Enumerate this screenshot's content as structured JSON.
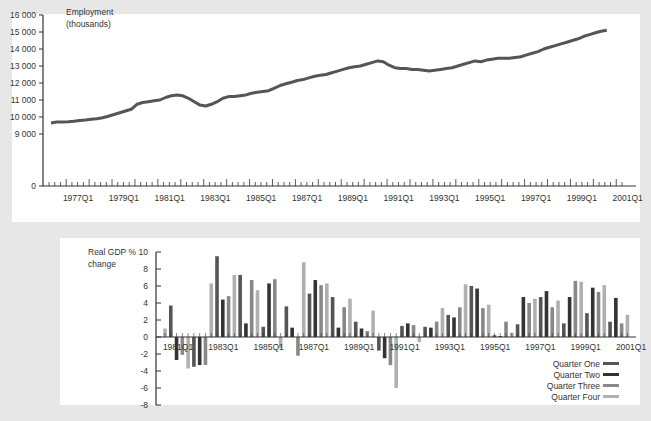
{
  "chart_data": [
    {
      "type": "line",
      "title": "Employment (thousands)",
      "ylabel_line1": "Employment",
      "ylabel_line2": "(thousands)",
      "xlabel": "",
      "yticks": [
        0,
        9000,
        10000,
        11000,
        12000,
        13000,
        14000,
        15000,
        16000
      ],
      "ytick_labels": [
        "0",
        "9 000",
        "10 000",
        "11 000",
        "12 000",
        "13 000",
        "14 000",
        "15 000",
        "16 000"
      ],
      "ylim": [
        0,
        16000
      ],
      "axis_break": "between 0 and 9000",
      "xtick_labels": [
        "1977Q1",
        "1979Q1",
        "1981Q1",
        "1983Q1",
        "1985Q1",
        "1987Q1",
        "1989Q1",
        "1991Q1",
        "1993Q1",
        "1995Q1",
        "1997Q1",
        "1999Q1",
        "2001Q1"
      ],
      "x_start": "1976Q2",
      "x_end": "2001Q2",
      "series": [
        {
          "name": "Employment",
          "color": "#555555",
          "annual_q1_values": {
            "1976": 9650,
            "1977": 9750,
            "1978": 9900,
            "1979": 10250,
            "1980": 10850,
            "1981": 11150,
            "1982": 11100,
            "1983": 10750,
            "1984": 11200,
            "1985": 11450,
            "1986": 11850,
            "1987": 12200,
            "1988": 12500,
            "1989": 12900,
            "1990": 13200,
            "1991": 12900,
            "1992": 12800,
            "1993": 12700,
            "1994": 12900,
            "1995": 13300,
            "1996": 13450,
            "1997": 13650,
            "1998": 14000,
            "1999": 14400,
            "2000": 14800,
            "2001": 15050
          },
          "values": [
            9650,
            9700,
            9700,
            9720,
            9750,
            9800,
            9830,
            9870,
            9900,
            9950,
            10050,
            10150,
            10250,
            10350,
            10450,
            10750,
            10850,
            10900,
            10950,
            11000,
            11150,
            11250,
            11300,
            11250,
            11100,
            10900,
            10700,
            10650,
            10750,
            10900,
            11100,
            11200,
            11200,
            11250,
            11300,
            11400,
            11450,
            11500,
            11550,
            11700,
            11850,
            11950,
            12050,
            12150,
            12200,
            12300,
            12400,
            12450,
            12500,
            12600,
            12700,
            12800,
            12900,
            12950,
            13000,
            13100,
            13200,
            13300,
            13250,
            13050,
            12900,
            12850,
            12850,
            12800,
            12800,
            12750,
            12700,
            12750,
            12800,
            12850,
            12900,
            13000,
            13100,
            13200,
            13300,
            13250,
            13350,
            13400,
            13450,
            13450,
            13450,
            13500,
            13550,
            13650,
            13750,
            13850,
            14000,
            14100,
            14200,
            14300,
            14400,
            14500,
            14600,
            14750,
            14850,
            14950,
            15050,
            15100
          ]
        }
      ]
    },
    {
      "type": "bar",
      "title": "Real GDP % change",
      "ylabel_line1": "Real GDP %",
      "ylabel_line2": "change",
      "yticks": [
        -8,
        -6,
        -4,
        -2,
        0,
        2,
        4,
        6,
        8,
        10
      ],
      "ylim": [
        -8,
        10
      ],
      "xtick_labels": [
        "1981Q1",
        "1983Q1",
        "1985Q1",
        "1987Q1",
        "1989Q1",
        "1991Q1",
        "1993Q1",
        "1995Q1",
        "1997Q1",
        "1999Q1",
        "2001Q1"
      ],
      "legend_position": "lower right",
      "series_colors": {
        "Quarter One": "#555555",
        "Quarter Two": "#333333",
        "Quarter Three": "#888888",
        "Quarter Four": "#b0b0b0"
      },
      "categories": [
        "1980Q4",
        "1981Q1",
        "1981Q2",
        "1981Q3",
        "1981Q4",
        "1982Q1",
        "1982Q2",
        "1982Q3",
        "1982Q4",
        "1983Q1",
        "1983Q2",
        "1983Q3",
        "1983Q4",
        "1984Q1",
        "1984Q2",
        "1984Q3",
        "1984Q4",
        "1985Q1",
        "1985Q2",
        "1985Q3",
        "1985Q4",
        "1986Q1",
        "1986Q2",
        "1986Q3",
        "1986Q4",
        "1987Q1",
        "1987Q2",
        "1987Q3",
        "1987Q4",
        "1988Q1",
        "1988Q2",
        "1988Q3",
        "1988Q4",
        "1989Q1",
        "1989Q2",
        "1989Q3",
        "1989Q4",
        "1990Q1",
        "1990Q2",
        "1990Q3",
        "1990Q4",
        "1991Q1",
        "1991Q2",
        "1991Q3",
        "1991Q4",
        "1992Q1",
        "1992Q2",
        "1992Q3",
        "1992Q4",
        "1993Q1",
        "1993Q2",
        "1993Q3",
        "1993Q4",
        "1994Q1",
        "1994Q2",
        "1994Q3",
        "1994Q4",
        "1995Q1",
        "1995Q2",
        "1995Q3",
        "1995Q4",
        "1996Q1",
        "1996Q2",
        "1996Q3",
        "1996Q4",
        "1997Q1",
        "1997Q2",
        "1997Q3",
        "1997Q4",
        "1998Q1",
        "1998Q2",
        "1998Q3",
        "1998Q4",
        "1999Q1",
        "1999Q2",
        "1999Q3",
        "1999Q4",
        "2000Q1",
        "2000Q2",
        "2000Q3",
        "2000Q4",
        "2001Q1"
      ],
      "values": [
        1.0,
        3.7,
        -2.7,
        -2.1,
        -3.7,
        -3.5,
        -3.3,
        -3.3,
        6.3,
        9.5,
        4.4,
        4.8,
        7.3,
        7.3,
        1.6,
        6.7,
        5.5,
        1.2,
        6.3,
        6.8,
        -1.3,
        3.6,
        1.1,
        -2.2,
        8.8,
        5.1,
        6.7,
        6.1,
        6.3,
        4.7,
        1.1,
        3.5,
        4.5,
        1.8,
        1.0,
        0.7,
        3.1,
        -1.6,
        -2.5,
        -3.3,
        -6.0,
        1.3,
        1.6,
        1.4,
        -0.6,
        1.2,
        1.1,
        1.8,
        3.4,
        2.6,
        2.3,
        3.5,
        6.2,
        6.0,
        5.7,
        3.4,
        3.8,
        0.2,
        0.1,
        1.8,
        0.5,
        1.5,
        4.7,
        4.0,
        4.5,
        4.7,
        5.4,
        3.5,
        4.3,
        1.6,
        4.7,
        6.6,
        6.5,
        2.8,
        5.8,
        5.3,
        6.1,
        1.8,
        4.6,
        1.6,
        2.6
      ]
    }
  ],
  "legend": [
    {
      "label": "Quarter One",
      "color": "#555555"
    },
    {
      "label": "Quarter Two",
      "color": "#333333"
    },
    {
      "label": "Quarter Three",
      "color": "#888888"
    },
    {
      "label": "Quarter Four",
      "color": "#b0b0b0"
    }
  ]
}
